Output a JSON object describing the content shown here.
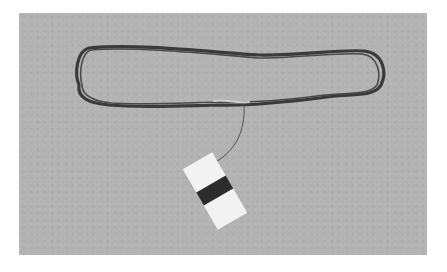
{
  "image": {
    "description": "Photograph of a long dark loop of thread or yarn lying on a grey surface, with a thin strand leading to a small white card wound with dark thread",
    "subject": "thread skein loop with winding card",
    "colors": {
      "background_page": "#ffffff",
      "surface": "#b3b3b3",
      "thread": "#3a3a3a",
      "card": "#f2f2f2",
      "card_band": "#2c2c2c"
    }
  }
}
